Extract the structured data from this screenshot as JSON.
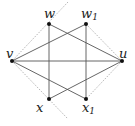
{
  "diagram": {
    "type": "graph",
    "nodes": [
      {
        "id": "w",
        "label": "w",
        "sub": "",
        "x": 49,
        "y": 24
      },
      {
        "id": "w1",
        "label": "w",
        "sub": "1",
        "x": 86,
        "y": 24
      },
      {
        "id": "v",
        "label": "v",
        "sub": "",
        "x": 12,
        "y": 61
      },
      {
        "id": "u",
        "label": "u",
        "sub": "",
        "x": 122,
        "y": 61
      },
      {
        "id": "x",
        "label": "x",
        "sub": "",
        "x": 49,
        "y": 99
      },
      {
        "id": "x1",
        "label": "x",
        "sub": "1",
        "x": 86,
        "y": 99
      }
    ],
    "edges": [
      {
        "from": "v",
        "to": "u"
      },
      {
        "from": "v",
        "to": "w1"
      },
      {
        "from": "v",
        "to": "x1"
      },
      {
        "from": "w",
        "to": "u"
      },
      {
        "from": "x",
        "to": "u"
      },
      {
        "from": "w",
        "to": "x"
      },
      {
        "from": "w1",
        "to": "x1"
      }
    ],
    "dotted_lines": [
      {
        "x1": 68,
        "y1": 2,
        "x2": 12,
        "y2": 61
      },
      {
        "x1": 12,
        "y1": 61,
        "x2": 68,
        "y2": 119
      },
      {
        "x1": 86,
        "y1": 24,
        "x2": 122,
        "y2": 61
      },
      {
        "x1": 122,
        "y1": 61,
        "x2": 86,
        "y2": 99
      }
    ],
    "colors": {
      "edge": "#555555",
      "dotted": "#888888",
      "node": "#111111"
    }
  }
}
